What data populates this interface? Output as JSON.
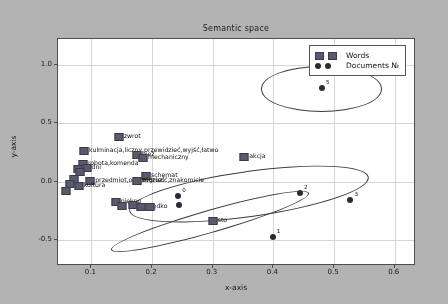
{
  "chart_data": {
    "type": "scatter",
    "title": "Semantic space",
    "xlabel": "x-axis",
    "ylabel": "y-axis",
    "xlim": [
      0.045,
      0.635
    ],
    "ylim": [
      -0.72,
      1.22
    ],
    "xticks": [
      "0.1",
      "0.2",
      "0.3",
      "0.4",
      "0.5",
      "0.6"
    ],
    "xtick_values": [
      0.1,
      0.2,
      0.3,
      0.4,
      0.5,
      0.6
    ],
    "yticks": [
      "1.0",
      "0.5",
      "0.0",
      "-0.5"
    ],
    "ytick_values": [
      1.0,
      0.5,
      0.0,
      -0.5
    ],
    "grid": true,
    "legend_position": "upper right",
    "legend": [
      {
        "label": "Words",
        "marker": "square",
        "color": "#5a5a6e"
      },
      {
        "label": "Documents №",
        "marker": "circle",
        "color": "#2b2b33"
      }
    ],
    "series": [
      {
        "name": "Words",
        "marker": "square",
        "color": "#5a5a6e",
        "points": [
          {
            "x": 0.145,
            "y": 0.385,
            "label": "zwrot"
          },
          {
            "x": 0.088,
            "y": 0.262,
            "label": "kulminacja,liczny,przewidzieć,wyjść,łatwo"
          },
          {
            "x": 0.175,
            "y": 0.232,
            "label": "bież"
          },
          {
            "x": 0.185,
            "y": 0.205,
            "label": "mechaniczny"
          },
          {
            "x": 0.352,
            "y": 0.212,
            "label": "akcja"
          },
          {
            "x": 0.086,
            "y": 0.148,
            "label": "robota,komenda"
          },
          {
            "x": 0.092,
            "y": 0.12,
            "label": "dni"
          },
          {
            "x": 0.078,
            "y": 0.108,
            "label": ""
          },
          {
            "x": 0.082,
            "y": 0.086,
            "label": ""
          },
          {
            "x": 0.19,
            "y": 0.05,
            "label": "schemat"
          },
          {
            "x": 0.071,
            "y": 0.022,
            "label": ""
          },
          {
            "x": 0.098,
            "y": 0.01,
            "label": "przedmiot,och,widzieć"
          },
          {
            "x": 0.175,
            "y": 0.008,
            "label": "zagrozić,znakomicie"
          },
          {
            "x": 0.064,
            "y": -0.02,
            "label": ""
          },
          {
            "x": 0.079,
            "y": -0.034,
            "label": "kultura"
          },
          {
            "x": 0.058,
            "y": -0.082,
            "label": ""
          },
          {
            "x": 0.14,
            "y": -0.175,
            "label": "piękno"
          },
          {
            "x": 0.15,
            "y": -0.205,
            "label": ""
          },
          {
            "x": 0.168,
            "y": -0.202,
            "label": ""
          },
          {
            "x": 0.182,
            "y": -0.215,
            "label": "prędko"
          },
          {
            "x": 0.196,
            "y": -0.218,
            "label": ""
          },
          {
            "x": 0.3,
            "y": -0.338,
            "label": "sto"
          }
        ]
      },
      {
        "name": "Documents №",
        "marker": "circle",
        "color": "#2b2b33",
        "points": [
          {
            "x": 0.48,
            "y": 0.8,
            "label": "5"
          },
          {
            "x": 0.444,
            "y": -0.095,
            "label": "2"
          },
          {
            "x": 0.527,
            "y": -0.16,
            "label": "3"
          },
          {
            "x": 0.243,
            "y": -0.12,
            "label": "0"
          },
          {
            "x": 0.244,
            "y": -0.198,
            "label": ""
          },
          {
            "x": 0.399,
            "y": -0.468,
            "label": "1"
          }
        ]
      }
    ],
    "ellipses": [
      {
        "name": "cluster-top",
        "cx": 0.478,
        "cy": 0.8,
        "rx": 0.098,
        "ry": 0.185,
        "angle": 0
      },
      {
        "name": "cluster-middle",
        "cx": 0.358,
        "cy": -0.095,
        "rx": 0.198,
        "ry": 0.19,
        "angle": -8
      },
      {
        "name": "cluster-bottom",
        "cx": 0.293,
        "cy": -0.33,
        "rx": 0.168,
        "ry": 0.09,
        "angle": -16
      }
    ]
  },
  "figure": {
    "title": "Semantic space",
    "xlabel": "x-axis",
    "ylabel": "y-axis",
    "background": "#b3b3b3",
    "plot_background": "#ffffff"
  }
}
